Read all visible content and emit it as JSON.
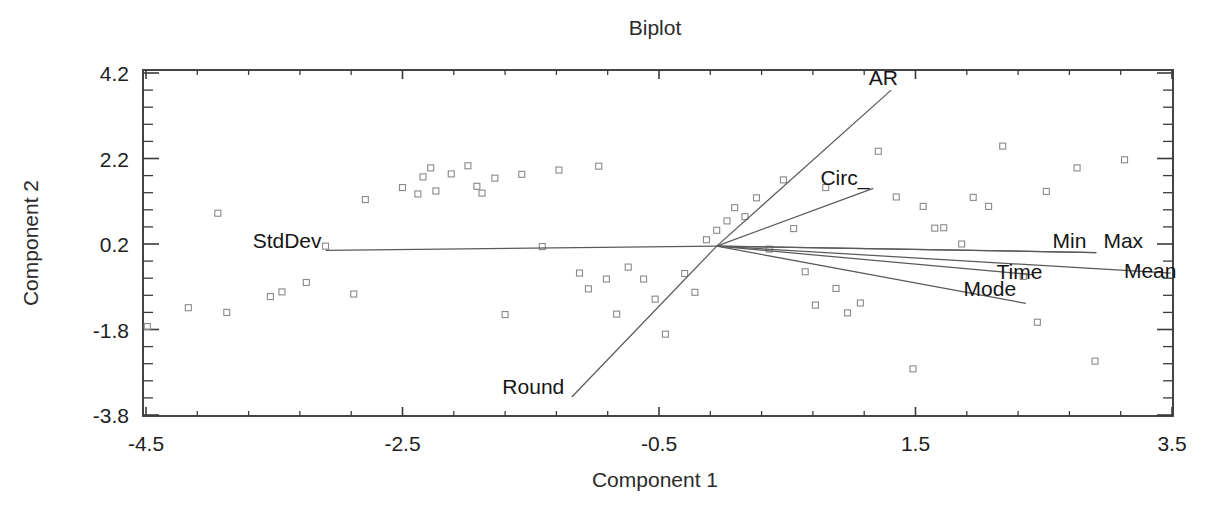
{
  "chart_data": {
    "type": "scatter",
    "title": "Biplot",
    "xlabel": "Component 1",
    "ylabel": "Component 2",
    "xlim": [
      -4.9,
      3.5
    ],
    "ylim": [
      -3.8,
      4.35
    ],
    "grid": false,
    "legend": "none",
    "xticks": [
      -4.5,
      -2.5,
      -0.5,
      1.5,
      3.5
    ],
    "xtick_labels": [
      "-4.5",
      "-2.5",
      "-0.5",
      "1.5",
      "3.5"
    ],
    "yticks": [
      -3.8,
      -1.8,
      0.2,
      2.2,
      4.2
    ],
    "ytick_labels": [
      "-3.8",
      "-1.8",
      "0.2",
      "2.2",
      "4.2"
    ],
    "minor_ticks_per_interval": 4,
    "origin": {
      "x": -0.05,
      "y": 0.15
    },
    "vectors": [
      {
        "name": "AR",
        "label": "AR",
        "x": 1.31,
        "y": 3.8,
        "label_x": 1.25,
        "label_y": 4.09
      },
      {
        "name": "Circ",
        "label": "Circ_",
        "x": 1.17,
        "y": 1.5,
        "label_x": 0.95,
        "label_y": 1.74
      },
      {
        "name": "Min",
        "label": "Min",
        "x": 2.91,
        "y": 0.0,
        "label_x": 2.7,
        "label_y": 0.26
      },
      {
        "name": "Max",
        "label": "Max",
        "x": 2.91,
        "y": 0.0,
        "label_x": 3.12,
        "label_y": 0.26
      },
      {
        "name": "Mean",
        "label": "Mean",
        "x": 3.49,
        "y": -0.48,
        "label_x": 3.33,
        "label_y": -0.42
      },
      {
        "name": "Time",
        "label": "Time",
        "x": 2.42,
        "y": -0.52,
        "label_x": 2.31,
        "label_y": -0.46
      },
      {
        "name": "Mode",
        "label": "Mode",
        "x": 2.36,
        "y": -1.19,
        "label_x": 2.08,
        "label_y": -0.86
      },
      {
        "name": "StdDev",
        "label": "StdDev",
        "x": -3.1,
        "y": 0.05,
        "label_x": -3.4,
        "label_y": 0.28
      },
      {
        "name": "Round",
        "label": "Round",
        "x": -1.18,
        "y": -3.38,
        "label_x": -1.48,
        "label_y": -3.15
      }
    ],
    "points": [
      [
        -4.49,
        -1.73
      ],
      [
        -4.17,
        -1.29
      ],
      [
        -3.87,
        -1.4
      ],
      [
        -3.94,
        0.92
      ],
      [
        -3.53,
        -1.03
      ],
      [
        -3.44,
        -0.92
      ],
      [
        -3.25,
        -0.7
      ],
      [
        -3.1,
        0.15
      ],
      [
        -2.88,
        -0.97
      ],
      [
        -2.79,
        1.24
      ],
      [
        -2.5,
        1.52
      ],
      [
        -2.38,
        1.37
      ],
      [
        -2.34,
        1.77
      ],
      [
        -2.28,
        1.98
      ],
      [
        -2.24,
        1.44
      ],
      [
        -2.12,
        1.84
      ],
      [
        -1.99,
        2.03
      ],
      [
        -1.92,
        1.55
      ],
      [
        -1.88,
        1.39
      ],
      [
        -1.78,
        1.74
      ],
      [
        -1.7,
        -1.45
      ],
      [
        -1.57,
        1.83
      ],
      [
        -1.41,
        0.14
      ],
      [
        -1.28,
        1.93
      ],
      [
        -1.12,
        -0.48
      ],
      [
        -1.05,
        -0.85
      ],
      [
        -0.97,
        2.02
      ],
      [
        -0.91,
        -0.62
      ],
      [
        -0.83,
        -1.44
      ],
      [
        -0.74,
        -0.34
      ],
      [
        -0.62,
        -0.62
      ],
      [
        -0.53,
        -1.09
      ],
      [
        -0.45,
        -1.91
      ],
      [
        -0.3,
        -0.49
      ],
      [
        -0.22,
        -0.93
      ],
      [
        -0.13,
        0.3
      ],
      [
        -0.05,
        0.52
      ],
      [
        0.03,
        0.74
      ],
      [
        0.09,
        1.05
      ],
      [
        0.17,
        0.84
      ],
      [
        0.26,
        1.28
      ],
      [
        0.36,
        0.08
      ],
      [
        0.47,
        1.7
      ],
      [
        0.55,
        0.56
      ],
      [
        0.64,
        -0.45
      ],
      [
        0.72,
        -1.23
      ],
      [
        0.8,
        1.52
      ],
      [
        0.88,
        -0.84
      ],
      [
        0.97,
        -1.41
      ],
      [
        1.07,
        -1.18
      ],
      [
        1.21,
        2.37
      ],
      [
        1.35,
        1.3
      ],
      [
        1.48,
        -2.72
      ],
      [
        1.56,
        1.08
      ],
      [
        1.65,
        0.57
      ],
      [
        1.72,
        0.58
      ],
      [
        1.86,
        0.2
      ],
      [
        1.95,
        1.29
      ],
      [
        2.07,
        1.08
      ],
      [
        2.18,
        2.49
      ],
      [
        2.34,
        -0.56
      ],
      [
        2.45,
        -1.63
      ],
      [
        2.52,
        1.43
      ],
      [
        2.76,
        1.98
      ],
      [
        2.9,
        -2.54
      ],
      [
        3.13,
        2.17
      ]
    ]
  }
}
